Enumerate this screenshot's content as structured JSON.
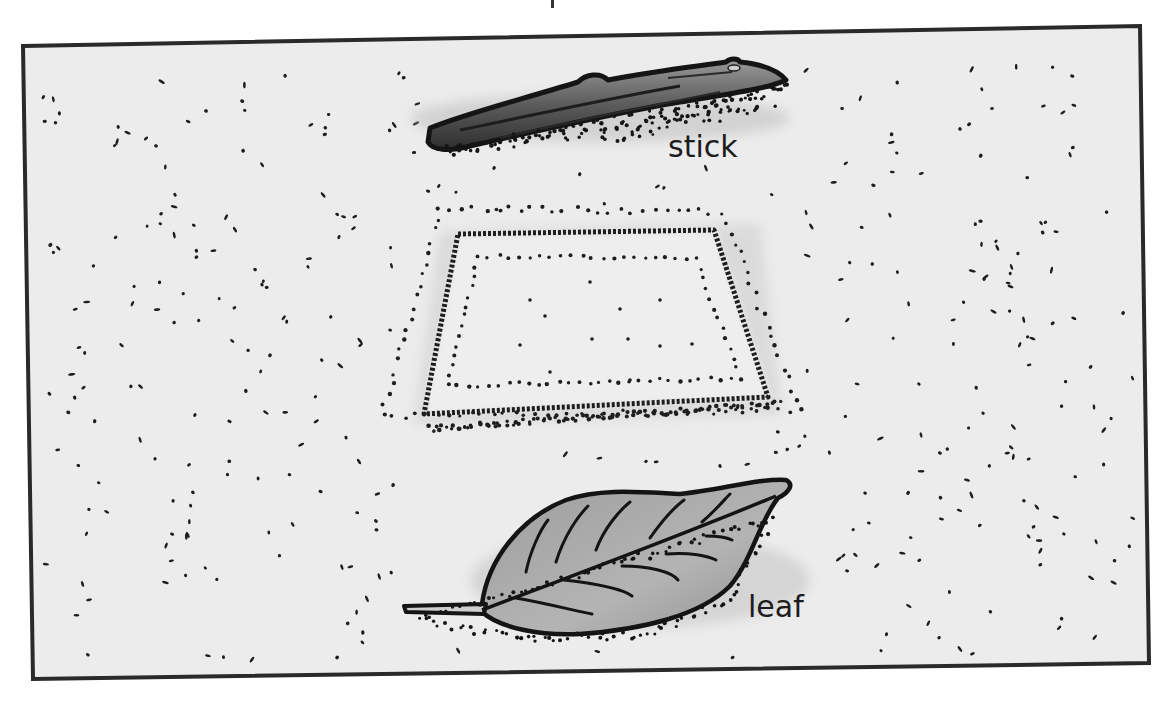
{
  "illustration": {
    "description": "Sandy soil scene with a stick, a rectangular impression in the ground, and a leaf",
    "colors": {
      "background": "#ffffff",
      "ground": "#ededed",
      "frame": "#2a2a2a",
      "ink": "#1a1a1a",
      "stick_fill": "#6a6a6a",
      "leaf_fill": "#a9a9a9"
    },
    "objects": [
      {
        "id": "stick",
        "label": "stick"
      },
      {
        "id": "imprint",
        "label": ""
      },
      {
        "id": "leaf",
        "label": "leaf"
      }
    ],
    "labels": {
      "stick": "stick",
      "leaf": "leaf"
    }
  }
}
